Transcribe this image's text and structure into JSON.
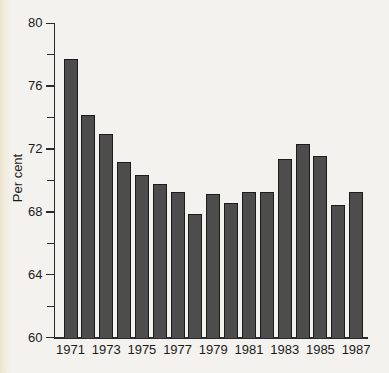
{
  "chart_data": {
    "type": "bar",
    "title": "",
    "xlabel": "",
    "ylabel": "Per cent",
    "ylim": [
      60,
      80
    ],
    "grid": false,
    "legend": null,
    "y_major_ticks": [
      80,
      76,
      72,
      68,
      64,
      60
    ],
    "y_minor_ticks": [
      78,
      74,
      70,
      66,
      62
    ],
    "x_tick_labels": [
      "1971",
      "1973",
      "1975",
      "1977",
      "1979",
      "1981",
      "1983",
      "1985",
      "1987"
    ],
    "categories": [
      "1971",
      "1972",
      "1973",
      "1974",
      "1975",
      "1976",
      "1977",
      "1978",
      "1979",
      "1980",
      "1981",
      "1982",
      "1983",
      "1984",
      "1985",
      "1986",
      "1987"
    ],
    "values": [
      77.7,
      74.1,
      72.9,
      71.1,
      70.3,
      69.7,
      69.2,
      67.8,
      69.1,
      68.5,
      69.2,
      69.2,
      71.3,
      72.3,
      71.5,
      68.4,
      69.2
    ],
    "colors": {
      "bar_fill": "#4d4d4d",
      "bar_border": "#1c1c1c",
      "axis": "#2b2b2b",
      "text": "#1a1a1a",
      "background": "#f4f2ee"
    }
  }
}
